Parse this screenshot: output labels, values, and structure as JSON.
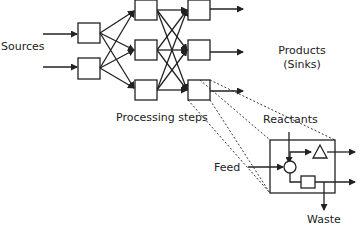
{
  "labels": {
    "sources": "Sources",
    "products_line1": "Products",
    "products_line2": "(Sinks)",
    "processing_steps": "Processing steps",
    "reactants": "Reactants",
    "feed": "Feed",
    "waste": "Waste"
  },
  "diagram": {
    "type": "process-network",
    "columns": [
      {
        "name": "source-units",
        "count": 2
      },
      {
        "name": "intermediate-units",
        "count": 3
      },
      {
        "name": "final-units",
        "count": 3
      }
    ],
    "inset": {
      "description": "Detail of a processing step",
      "symbols": [
        "circle-mixer",
        "triangle-reactor",
        "square-separator"
      ],
      "inputs": [
        "Reactants",
        "Feed"
      ],
      "outputs": [
        "product-1",
        "product-2",
        "Waste"
      ]
    },
    "stroke_color": "#222222"
  }
}
